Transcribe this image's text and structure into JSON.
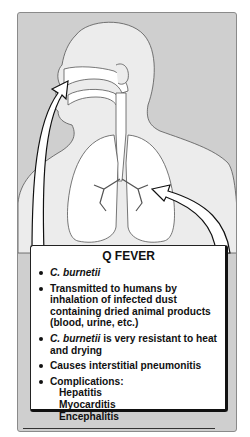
{
  "figure": {
    "title": "Q FEVER",
    "illustration": {
      "subject": "human head and torso silhouette with respiratory tract and lungs",
      "arrows": [
        "inhalation-arrow-to-nose",
        "arrow-to-lungs"
      ]
    },
    "bullets": [
      {
        "italic_prefix": "C. burnetii",
        "text": ""
      },
      {
        "italic_prefix": "",
        "text": "Transmitted to humans by inhalation of infected dust containing dried animal products (blood, urine, etc.)"
      },
      {
        "italic_prefix": "C. burnetii",
        "text": " is very resistant to heat and drying"
      },
      {
        "italic_prefix": "",
        "text": "Causes interstitial pneumonitis"
      },
      {
        "italic_prefix": "",
        "text": "Complications:",
        "sub_items": [
          "Hepatitis",
          "Myocarditis",
          "Encephalitis"
        ]
      }
    ]
  },
  "colors": {
    "panel_bg": "#cfcfcf",
    "body_fill": "#e9e9e9",
    "box_bg": "#ffffff",
    "ink": "#111111"
  }
}
